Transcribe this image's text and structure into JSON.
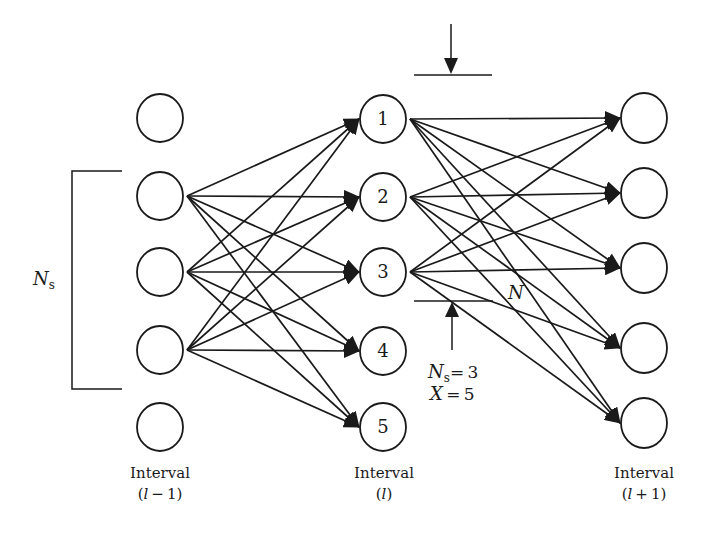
{
  "figure": {
    "colors": {
      "stroke": "#1a1a1a",
      "background": "#ffffff"
    },
    "columns": [
      {
        "id": "left",
        "caption_line1": "Interval",
        "caption_line2": "(l − 1)",
        "caption_var": "l",
        "caption_suffix": " − 1)",
        "x": 160,
        "nodes": [
          {
            "label": "",
            "y": 118
          },
          {
            "label": "",
            "y": 196
          },
          {
            "label": "",
            "y": 272
          },
          {
            "label": "",
            "y": 350
          },
          {
            "label": "",
            "y": 427
          }
        ]
      },
      {
        "id": "middle",
        "caption_line1": "Interval",
        "caption_var": "l",
        "caption_suffix": ")",
        "x": 383,
        "nodes": [
          {
            "label": "1",
            "y": 119
          },
          {
            "label": "2",
            "y": 197
          },
          {
            "label": "3",
            "y": 272
          },
          {
            "label": "4",
            "y": 351
          },
          {
            "label": "5",
            "y": 427
          }
        ]
      },
      {
        "id": "right",
        "caption_line1": "Interval",
        "caption_var": "l",
        "caption_suffix": " + 1)",
        "x": 644,
        "nodes": [
          {
            "label": "",
            "y": 118
          },
          {
            "label": "",
            "y": 193
          },
          {
            "label": "",
            "y": 268
          },
          {
            "label": "",
            "y": 348
          },
          {
            "label": "",
            "y": 423
          }
        ]
      }
    ],
    "edges": {
      "left_to_middle": {
        "sources": [
          1,
          2,
          3
        ],
        "targets": [
          0,
          1,
          2,
          3,
          4
        ]
      },
      "middle_to_right": {
        "sources": [
          0,
          1,
          2
        ],
        "targets": [
          0,
          1,
          2,
          3,
          4
        ]
      }
    },
    "bracket": {
      "label_main": "N",
      "label_sub": "s"
    },
    "window_annotation": {
      "n_label": "N",
      "ns_main": "N",
      "ns_sub": "s",
      "ns_value": "= 3",
      "x_main": "X",
      "x_value": " = 5"
    }
  }
}
